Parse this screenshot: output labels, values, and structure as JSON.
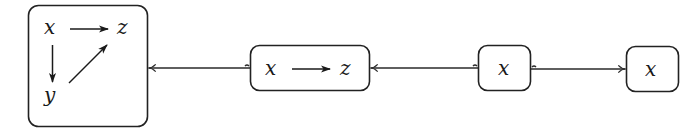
{
  "diagram": {
    "type": "commutative-diagram-chain",
    "nodes": [
      {
        "id": "full",
        "vars": [
          {
            "name": "x"
          },
          {
            "name": "z"
          },
          {
            "name": "y"
          }
        ],
        "edges": [
          {
            "from": "x",
            "to": "z"
          },
          {
            "from": "x",
            "to": "y"
          },
          {
            "from": "y",
            "to": "z"
          }
        ]
      },
      {
        "id": "xz",
        "vars": [
          {
            "name": "x"
          },
          {
            "name": "z"
          }
        ],
        "edges": [
          {
            "from": "x",
            "to": "z"
          }
        ]
      },
      {
        "id": "x1",
        "vars": [
          {
            "name": "x"
          }
        ],
        "edges": []
      },
      {
        "id": "x2",
        "vars": [
          {
            "name": "x"
          }
        ],
        "edges": []
      }
    ],
    "links": [
      {
        "from": "xz",
        "to": "full",
        "style": "hook-arrow"
      },
      {
        "from": "x1",
        "to": "xz",
        "style": "hook-arrow"
      },
      {
        "from": "x1",
        "to": "x2",
        "style": "hook-arrow"
      }
    ],
    "colors": {
      "stroke": "#222222",
      "background": "#ffffff"
    }
  }
}
